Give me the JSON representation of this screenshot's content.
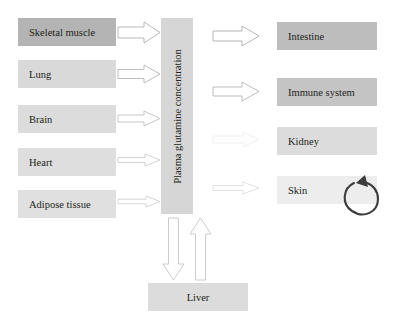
{
  "diagram": {
    "background_color": "#ffffff",
    "center": {
      "label": "Plasma glutamine concentration",
      "fill": "#d6d6d6",
      "x": 161,
      "y": 18,
      "width": 32,
      "height": 196,
      "orientation": "vertical-rotated-90"
    },
    "producers": [
      {
        "label": "Skeletal muscle",
        "fill": "#b4b4b4",
        "x": 18,
        "y": 18,
        "width": 98,
        "height": 28,
        "arrow": {
          "x": 118,
          "y": 22,
          "width": 42,
          "height": 21,
          "thickness": "largest",
          "shade": "#b0b0b0",
          "direction": "right"
        }
      },
      {
        "label": "Lung",
        "fill": "#d9d9d9",
        "x": 18,
        "y": 60,
        "width": 98,
        "height": 28,
        "arrow": {
          "x": 118,
          "y": 65,
          "width": 42,
          "height": 18,
          "thickness": "large",
          "shade": "#b4b4b4",
          "direction": "right"
        }
      },
      {
        "label": "Brain",
        "fill": "#dcdcdc",
        "x": 18,
        "y": 105,
        "width": 98,
        "height": 28,
        "arrow": {
          "x": 118,
          "y": 111,
          "width": 42,
          "height": 15,
          "thickness": "medium",
          "shade": "#bcbcbc",
          "direction": "right"
        }
      },
      {
        "label": "Heart",
        "fill": "#dedede",
        "x": 18,
        "y": 148,
        "width": 98,
        "height": 28,
        "arrow": {
          "x": 118,
          "y": 154,
          "width": 42,
          "height": 12,
          "thickness": "small",
          "shade": "#c6c6c6",
          "direction": "right"
        }
      },
      {
        "label": "Adipose tissue",
        "fill": "#e0e0e0",
        "x": 18,
        "y": 190,
        "width": 98,
        "height": 28,
        "arrow": {
          "x": 118,
          "y": 195,
          "width": 42,
          "height": 10,
          "thickness": "smallest",
          "shade": "#cdcdcd",
          "direction": "right"
        }
      }
    ],
    "consumers": [
      {
        "label": "Intestine",
        "fill": "#bdbdbd",
        "x": 277,
        "y": 22,
        "width": 100,
        "height": 28,
        "arrow": {
          "x": 213,
          "y": 26,
          "width": 46,
          "height": 20,
          "thickness": "largest",
          "shade": "#aeaeae",
          "direction": "right"
        }
      },
      {
        "label": "Immune system",
        "fill": "#c4c4c4",
        "x": 277,
        "y": 78,
        "width": 100,
        "height": 28,
        "arrow": {
          "x": 213,
          "y": 82,
          "width": 46,
          "height": 19,
          "thickness": "large",
          "shade": "#b5b5b5",
          "direction": "right"
        }
      },
      {
        "label": "Kidney",
        "fill": "#dcdcdc",
        "x": 277,
        "y": 127,
        "width": 100,
        "height": 28,
        "arrow": {
          "x": 213,
          "y": 132,
          "width": 46,
          "height": 15,
          "thickness": "faint",
          "shade": "#efefef",
          "direction": "right"
        }
      },
      {
        "label": "Skin",
        "fill": "#ededed",
        "x": 277,
        "y": 176,
        "width": 100,
        "height": 28,
        "arrow": {
          "x": 213,
          "y": 182,
          "width": 46,
          "height": 12,
          "thickness": "thin",
          "shade": "#d8d8d8",
          "direction": "right"
        }
      }
    ],
    "liver": {
      "label": "Liver",
      "fill": "#dcdcdc",
      "x": 148,
      "y": 283,
      "width": 100,
      "height": 28
    },
    "liver_arrows": [
      {
        "name": "arrow-center-to-liver",
        "direction": "down",
        "x": 163,
        "y": 218,
        "width": 21,
        "height": 62,
        "shade": "#c6c6c6"
      },
      {
        "name": "arrow-liver-to-center",
        "direction": "up",
        "x": 190,
        "y": 218,
        "width": 21,
        "height": 62,
        "shade": "#c6c6c6"
      }
    ],
    "cycle_arrow": {
      "name": "skin-cycle-arrow",
      "description": "circular recycling arrow",
      "x": 338,
      "y": 171,
      "width": 44,
      "height": 46,
      "stroke": "#3c3c3c"
    }
  }
}
